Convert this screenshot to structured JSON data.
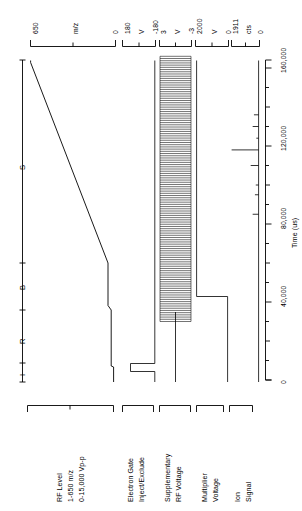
{
  "figure": {
    "type": "timing-diagram",
    "orientation": "rotated-90"
  },
  "chart_data": {
    "type": "line",
    "xlabel": "Time (us)",
    "ylabel": "",
    "xlim": [
      0,
      170000
    ],
    "grid": false,
    "legend": "none",
    "xticks": [
      0,
      40000,
      80000,
      120000,
      160000
    ],
    "xtick_labels": [
      "0",
      "40,000",
      "80,000",
      "120,000",
      "160,000"
    ],
    "phase_markers": [
      {
        "label": "I",
        "time": 8000
      },
      {
        "label": "R",
        "time": 30000
      },
      {
        "label": "B",
        "time": 57000
      },
      {
        "label": "S",
        "time": 110000
      }
    ],
    "series": [
      {
        "name": "RF Level",
        "unit": "m/z",
        "range_label": "1-650 m/z",
        "amplitude_label": "0-15,000 Vp-p",
        "axis_max": 650,
        "axis_min": 0,
        "axis_top_label": "650",
        "axis_mid_label": "m/z",
        "axis_bottom_label": "0",
        "points": [
          [
            0,
            30
          ],
          [
            6000,
            30
          ],
          [
            7000,
            38
          ],
          [
            48000,
            38
          ],
          [
            52000,
            60
          ],
          [
            57000,
            60
          ],
          [
            160000,
            650
          ],
          [
            166000,
            650
          ]
        ]
      },
      {
        "name": "Electron Gate Inject/Exclude",
        "axis_top_label": "180",
        "axis_mid_label": "V",
        "axis_bottom_label": "-180",
        "axis_max": 180,
        "axis_min": -180,
        "points": [
          [
            0,
            -180
          ],
          [
            4000,
            -180
          ],
          [
            4500,
            180
          ],
          [
            11000,
            180
          ],
          [
            11500,
            -180
          ],
          [
            166000,
            -180
          ]
        ]
      },
      {
        "name": "Supplementary RF Voltage",
        "axis_top_label": "3",
        "axis_mid_label": "V",
        "axis_bottom_label": "-3",
        "axis_max": 3,
        "axis_min": -3,
        "waveform": "oscillation-burst",
        "burst_start": 30000,
        "burst_end": 166000,
        "cycles": 120,
        "baseline": 0
      },
      {
        "name": "Multiplier Voltage",
        "axis_top_label": "2000",
        "axis_mid_label": "V",
        "axis_bottom_label": "0",
        "axis_max": 2000,
        "axis_min": 0,
        "points": [
          [
            0,
            0
          ],
          [
            45000,
            0
          ],
          [
            46000,
            2000
          ],
          [
            166000,
            2000
          ]
        ]
      },
      {
        "name": "Ion Signal",
        "axis_top_label": "1911",
        "axis_mid_label": "cts",
        "axis_bottom_label": "0",
        "axis_max": 1911,
        "axis_min": 0,
        "peaks": [
          {
            "time": 85000,
            "counts": 420
          },
          {
            "time": 95000,
            "counts": 260
          },
          {
            "time": 100000,
            "counts": 200
          },
          {
            "time": 110000,
            "counts": 560
          },
          {
            "time": 118000,
            "counts": 1911
          },
          {
            "time": 124000,
            "counts": 160
          },
          {
            "time": 130000,
            "counts": 420
          },
          {
            "time": 136000,
            "counts": 330
          }
        ]
      }
    ]
  },
  "axes": [
    {
      "id": "rf-level",
      "top": "650",
      "mid": "m/z",
      "bottom": "0",
      "caption_lines": [
        "RF Level",
        "1-650 m/z",
        "0-15,000 Vp-p"
      ]
    },
    {
      "id": "electron-gate",
      "top": "180",
      "mid": "V",
      "bottom": "-180",
      "caption_lines": [
        "Electron Gate",
        "Inject/Exclude"
      ]
    },
    {
      "id": "supplementary-rf",
      "top": "3",
      "mid": "V",
      "bottom": "-3",
      "caption_lines": [
        "Supplementary",
        "RF Voltage"
      ]
    },
    {
      "id": "multiplier-voltage",
      "top": "2000",
      "mid": "V",
      "bottom": "0",
      "caption_lines": [
        "Multiplier",
        "Voltage"
      ]
    },
    {
      "id": "ion-signal",
      "top": "1911",
      "mid": "cts",
      "bottom": "0",
      "caption_lines": [
        "Ion",
        "Signal"
      ]
    }
  ],
  "time_axis": {
    "label": "Time (us)",
    "ticks": [
      "160,000",
      "120,000",
      "80,000",
      "40,000",
      "0"
    ]
  },
  "phase_labels": {
    "s": "S",
    "b": "B",
    "r": "R",
    "i": "I"
  },
  "captions": {
    "rf_level_l1": "RF Level",
    "rf_level_l2": "1-650 m/z",
    "rf_level_l3": "0-15,000 Vp-p",
    "electron_gate_l1": "Electron Gate",
    "electron_gate_l2": "Inject/Exclude",
    "supp_rf_l1": "Supplementary",
    "supp_rf_l2": "RF Voltage",
    "mult_l1": "Multiplier",
    "mult_l2": "Voltage",
    "ion_l1": "Ion",
    "ion_l2": "Signal"
  },
  "colors": {
    "ink": "#000000",
    "paper": "#ffffff"
  }
}
